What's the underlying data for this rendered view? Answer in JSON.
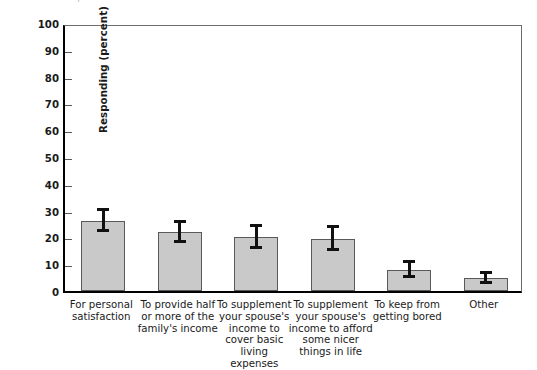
{
  "figure": {
    "cropped_header_text": "not possible when and do not do so when is",
    "background_color": "#ffffff",
    "bar_fill_color": "#c9c9c9",
    "bar_edge_color": "#595959",
    "error_bar_color": "#111111",
    "axis_color": "#000000"
  },
  "chart_data": {
    "type": "bar",
    "title": "",
    "xlabel": "",
    "ylabel": "Responding (percent)",
    "ylim": [
      0,
      100
    ],
    "ytick_step": 10,
    "ytick_labels": [
      "0",
      "10",
      "20",
      "30",
      "40",
      "50",
      "60",
      "70",
      "80",
      "90",
      "100"
    ],
    "ytick_values": [
      0,
      10,
      20,
      30,
      40,
      50,
      60,
      70,
      80,
      90,
      100
    ],
    "grid": false,
    "legend": false,
    "error_bars": true,
    "error_bar_style": "capped",
    "categories": [
      "For personal satisfaction",
      "To provide half or more of the family's income",
      "To supplement your spouse's income to cover basic living expenses",
      "To supplement your spouse's income to afford some nicer things in life",
      "To keep from getting bored",
      "Other"
    ],
    "category_lines": [
      [
        "For personal",
        "satisfaction"
      ],
      [
        "To provide half",
        "or more of the",
        "family's income"
      ],
      [
        "To supplement",
        "your spouse's",
        "income to",
        "cover basic living",
        "expenses"
      ],
      [
        "To supplement",
        "your spouse's",
        "income to afford",
        "some nicer",
        "things in life"
      ],
      [
        "To keep from",
        "getting bored"
      ],
      [
        "Other"
      ]
    ],
    "values": [
      26,
      22,
      20,
      19.5,
      8,
      5
    ],
    "error_upper": [
      5,
      4.5,
      5,
      5,
      3.5,
      2.5
    ],
    "error_lower": [
      4,
      4,
      4.5,
      4.5,
      3,
      2.5
    ]
  }
}
